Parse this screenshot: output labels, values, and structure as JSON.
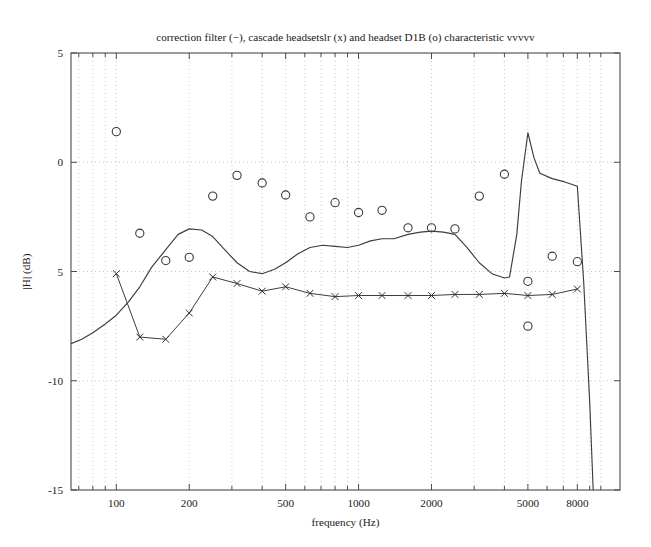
{
  "chart_data": {
    "type": "line",
    "title": "correction filter (−), cascade headsetslr (x) and headset D1B (o) characteristic  vvvvv",
    "xlabel": "frequency (Hz)",
    "ylabel": "|H| (dB)",
    "xscale": "log",
    "xlim": [
      65,
      12000
    ],
    "ylim": [
      -15,
      5
    ],
    "yticks": [
      5,
      0,
      -5,
      -10,
      -15
    ],
    "ytick_labels": [
      "5",
      "0",
      "5",
      "-10",
      "-15"
    ],
    "xticks": [
      100,
      200,
      500,
      1000,
      2000,
      5000,
      8000
    ],
    "xtick_labels": [
      "100",
      "200",
      "500",
      "1000",
      "2000",
      "5000",
      "8000"
    ],
    "grid": true,
    "grid_style": "dotted",
    "legend": null,
    "legend_position": "none",
    "series": [
      {
        "name": "correction filter",
        "marker": "none",
        "linestyle": "-",
        "x": [
          65,
          72,
          80,
          90,
          100,
          112,
          125,
          140,
          160,
          180,
          200,
          225,
          250,
          280,
          315,
          355,
          400,
          450,
          500,
          560,
          630,
          710,
          800,
          900,
          1000,
          1120,
          1250,
          1400,
          1600,
          1800,
          2000,
          2240,
          2500,
          2800,
          3150,
          3550,
          4000,
          4200,
          4500,
          4700,
          5000,
          5300,
          5600,
          6300,
          7100,
          8000,
          8500,
          9000,
          9300
        ],
        "y": [
          -8.3,
          -8.1,
          -7.8,
          -7.4,
          -7.0,
          -6.4,
          -5.7,
          -4.8,
          -4.0,
          -3.3,
          -3.05,
          -3.1,
          -3.4,
          -4.0,
          -4.6,
          -5.0,
          -5.1,
          -4.9,
          -4.6,
          -4.2,
          -3.9,
          -3.8,
          -3.85,
          -3.9,
          -3.8,
          -3.6,
          -3.5,
          -3.5,
          -3.3,
          -3.2,
          -3.15,
          -3.2,
          -3.3,
          -3.9,
          -4.6,
          -5.1,
          -5.3,
          -5.25,
          -3.3,
          -0.9,
          1.35,
          0.2,
          -0.5,
          -0.75,
          -0.9,
          -1.1,
          -5.5,
          -11.0,
          -15.0
        ]
      },
      {
        "name": "cascade headsetslr",
        "marker": "x",
        "linestyle": "-",
        "x": [
          100,
          125,
          160,
          200,
          250,
          315,
          400,
          500,
          630,
          800,
          1000,
          1250,
          1600,
          2000,
          2500,
          3150,
          4000,
          5000,
          6300,
          8000
        ],
        "y": [
          -5.1,
          -8.0,
          -8.1,
          -6.9,
          -5.25,
          -5.55,
          -5.9,
          -5.7,
          -6.0,
          -6.15,
          -6.1,
          -6.1,
          -6.1,
          -6.1,
          -6.05,
          -6.05,
          -6.0,
          -6.1,
          -6.05,
          -5.8
        ]
      },
      {
        "name": "headset D1B",
        "marker": "o",
        "linestyle": "none",
        "x": [
          100,
          125,
          160,
          200,
          250,
          315,
          400,
          500,
          630,
          800,
          1000,
          1250,
          1600,
          2000,
          2500,
          3150,
          4000,
          5000,
          5000,
          6300,
          8000
        ],
        "y": [
          1.4,
          -3.25,
          -4.5,
          -4.35,
          -1.55,
          -0.6,
          -0.95,
          -1.5,
          -2.5,
          -1.85,
          -2.3,
          -2.2,
          -3.0,
          -3.0,
          -3.05,
          -1.55,
          -0.55,
          -7.5,
          -5.45,
          -4.3,
          -4.55
        ]
      }
    ]
  }
}
